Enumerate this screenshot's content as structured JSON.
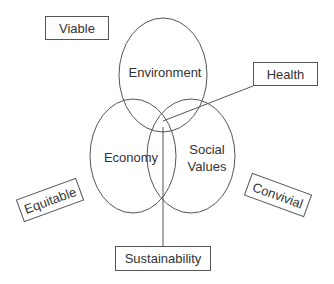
{
  "diagram": {
    "circles": [
      {
        "id": "environment",
        "label": "Environment",
        "cx": 163,
        "cy": 75,
        "rx": 44,
        "ry": 57
      },
      {
        "id": "economy",
        "label": "Economy",
        "cx": 133,
        "cy": 156,
        "rx": 43,
        "ry": 57
      },
      {
        "id": "social",
        "label": "Social Values",
        "label_lines": [
          "Social",
          "Values"
        ],
        "cx": 191,
        "cy": 156,
        "rx": 44,
        "ry": 57
      }
    ],
    "boxes": {
      "viable": "Viable",
      "health": "Health",
      "equitable": "Equitable",
      "convivial": "Convivial",
      "sustainability": "Sustainability"
    },
    "stroke_color": "#555555"
  }
}
